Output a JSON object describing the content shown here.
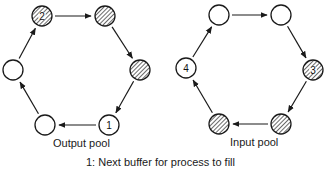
{
  "diagram": {
    "type": "circular-buffer-pools",
    "pools": [
      {
        "id": "output",
        "label": "Output pool",
        "direction": "clockwise",
        "nodes": [
          {
            "position": "top-left",
            "filled": true,
            "number": "2",
            "cx": 42,
            "cy": 16
          },
          {
            "position": "top-right",
            "filled": true,
            "number": "",
            "cx": 105,
            "cy": 16
          },
          {
            "position": "right",
            "filled": true,
            "number": "",
            "cx": 140,
            "cy": 70
          },
          {
            "position": "bottom-right",
            "filled": false,
            "number": "1",
            "cx": 109,
            "cy": 125
          },
          {
            "position": "bottom-left",
            "filled": false,
            "number": "",
            "cx": 45,
            "cy": 125
          },
          {
            "position": "left",
            "filled": false,
            "number": "",
            "cx": 13,
            "cy": 70
          }
        ]
      },
      {
        "id": "input",
        "label": "Input pool",
        "direction": "clockwise",
        "nodes": [
          {
            "position": "top-left",
            "filled": false,
            "number": "",
            "cx": 219,
            "cy": 15
          },
          {
            "position": "top-right",
            "filled": false,
            "number": "",
            "cx": 281,
            "cy": 15
          },
          {
            "position": "right",
            "filled": true,
            "number": "3",
            "cx": 313,
            "cy": 70
          },
          {
            "position": "bottom-right",
            "filled": true,
            "number": "",
            "cx": 281,
            "cy": 124
          },
          {
            "position": "bottom-left",
            "filled": true,
            "number": "",
            "cx": 219,
            "cy": 124
          },
          {
            "position": "left",
            "filled": false,
            "number": "4",
            "cx": 186,
            "cy": 68
          }
        ]
      }
    ],
    "legend": "1:  Next buffer for process to fill",
    "colors": {
      "stroke": "#1a1a1a",
      "hatch": "#1a1a1a",
      "background": "#ffffff"
    }
  }
}
